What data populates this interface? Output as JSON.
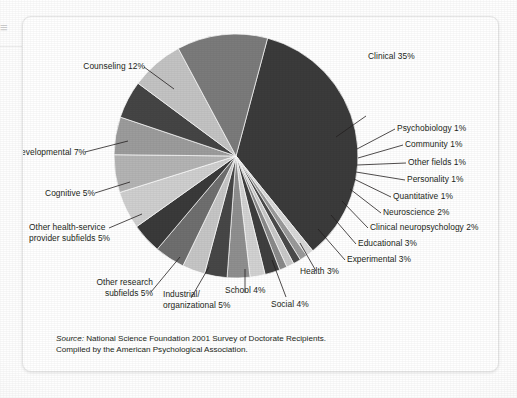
{
  "figure": {
    "source_prefix": "Source:",
    "source_line1": " National Science Foundation 2001 Survey of Doctorate Recipients.",
    "source_line2": "Compiled by the American Psychological Association."
  },
  "chart_data": {
    "type": "pie",
    "title": "",
    "subtitle": "",
    "xlabel": "",
    "ylabel": "",
    "legend_position": "callout-labels",
    "grid": false,
    "units": "percent",
    "total": 100,
    "start_angle_deg": -75,
    "direction": "clockwise",
    "categories": [
      "Clinical",
      "Psychobiology",
      "Community",
      "Other fields",
      "Personality",
      "Quantitative",
      "Neuroscience",
      "Clinical neuropsychology",
      "Educational",
      "Experimental",
      "Health",
      "Social",
      "School",
      "Industrial/organizational",
      "Other research subfields",
      "Other health-service provider subfields",
      "Cognitive",
      "Developmental",
      "Counseling"
    ],
    "values": [
      35,
      1,
      1,
      1,
      1,
      1,
      2,
      2,
      3,
      3,
      3,
      4,
      4,
      5,
      5,
      5,
      5,
      7,
      12
    ],
    "colors": [
      "#3b3b3b",
      "#d9d9d9",
      "#9a9a9a",
      "#4a4a4a",
      "#c9c9c9",
      "#8a8a8a",
      "#3f3f3f",
      "#d2d2d2",
      "#8f8f8f",
      "#474747",
      "#c6c6c6",
      "#6f6f6f",
      "#3a3a3a",
      "#cfcfcf",
      "#b4b4b4",
      "#9c9c9c",
      "#454545",
      "#c3c3c3",
      "#7b7b7b"
    ],
    "labels": [
      {
        "text": "Clinical 35%",
        "percent": 35
      },
      {
        "text": "Psychobiology 1%",
        "percent": 1
      },
      {
        "text": "Community 1%",
        "percent": 1
      },
      {
        "text": "Other fields 1%",
        "percent": 1
      },
      {
        "text": "Personality 1%",
        "percent": 1
      },
      {
        "text": "Quantitative 1%",
        "percent": 1
      },
      {
        "text": "Neuroscience 2%",
        "percent": 2
      },
      {
        "text": "Clinical neuropsychology 2%",
        "percent": 2
      },
      {
        "text": "Educational 3%",
        "percent": 3
      },
      {
        "text": "Experimental 3%",
        "percent": 3
      },
      {
        "text": "Health 3%",
        "percent": 3
      },
      {
        "text": "Social 4%",
        "percent": 4
      },
      {
        "text": "School 4%",
        "percent": 4
      },
      {
        "text": "Industrial/ organizational 5%",
        "percent": 5
      },
      {
        "text": "Other research subfields 5%",
        "percent": 5
      },
      {
        "text": "Other health-service provider subfields 5%",
        "percent": 5
      },
      {
        "text": "Cognitive 5%",
        "percent": 5
      },
      {
        "text": "Developmental 7%",
        "percent": 7
      },
      {
        "text": "Counseling 12%",
        "percent": 12
      }
    ]
  },
  "callouts": {
    "clinical": "Clinical 35%",
    "psychobiology": "Psychobiology 1%",
    "community": "Community 1%",
    "other_fields": "Other fields 1%",
    "personality": "Personality 1%",
    "quantitative": "Quantitative 1%",
    "neuroscience": "Neuroscience 2%",
    "clinical_neuropsychology": "Clinical neuropsychology 2%",
    "educational": "Educational 3%",
    "experimental": "Experimental 3%",
    "health": "Health 3%",
    "social": "Social 4%",
    "school": "School 4%",
    "industrial_1": "Industrial/",
    "industrial_2": "organizational 5%",
    "other_research_1": "Other research",
    "other_research_2": "subfields 5%",
    "other_hsp_1": "Other health-service",
    "other_hsp_2": "provider subfields 5%",
    "cognitive": "Cognitive 5%",
    "developmental": "Developmental 7%",
    "counseling": "Counseling 12%"
  },
  "edge": {
    "marginal_glyph": "≡"
  }
}
